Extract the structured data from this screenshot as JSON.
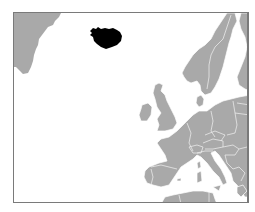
{
  "map": {
    "title": "Locator map of Iceland in Europe",
    "highlighted_region": "Iceland",
    "colors": {
      "highlight": "#000000",
      "land": "#a9a9a9",
      "water": "#ffffff",
      "frame": "#7a7a7a",
      "borders": "#ffffff"
    },
    "regions_visible": [
      "Greenland",
      "Iceland",
      "Scandinavia",
      "Finland",
      "British Isles",
      "Western Europe",
      "Central Europe",
      "Iberian Peninsula",
      "Italy",
      "Balkans",
      "North Africa"
    ]
  }
}
